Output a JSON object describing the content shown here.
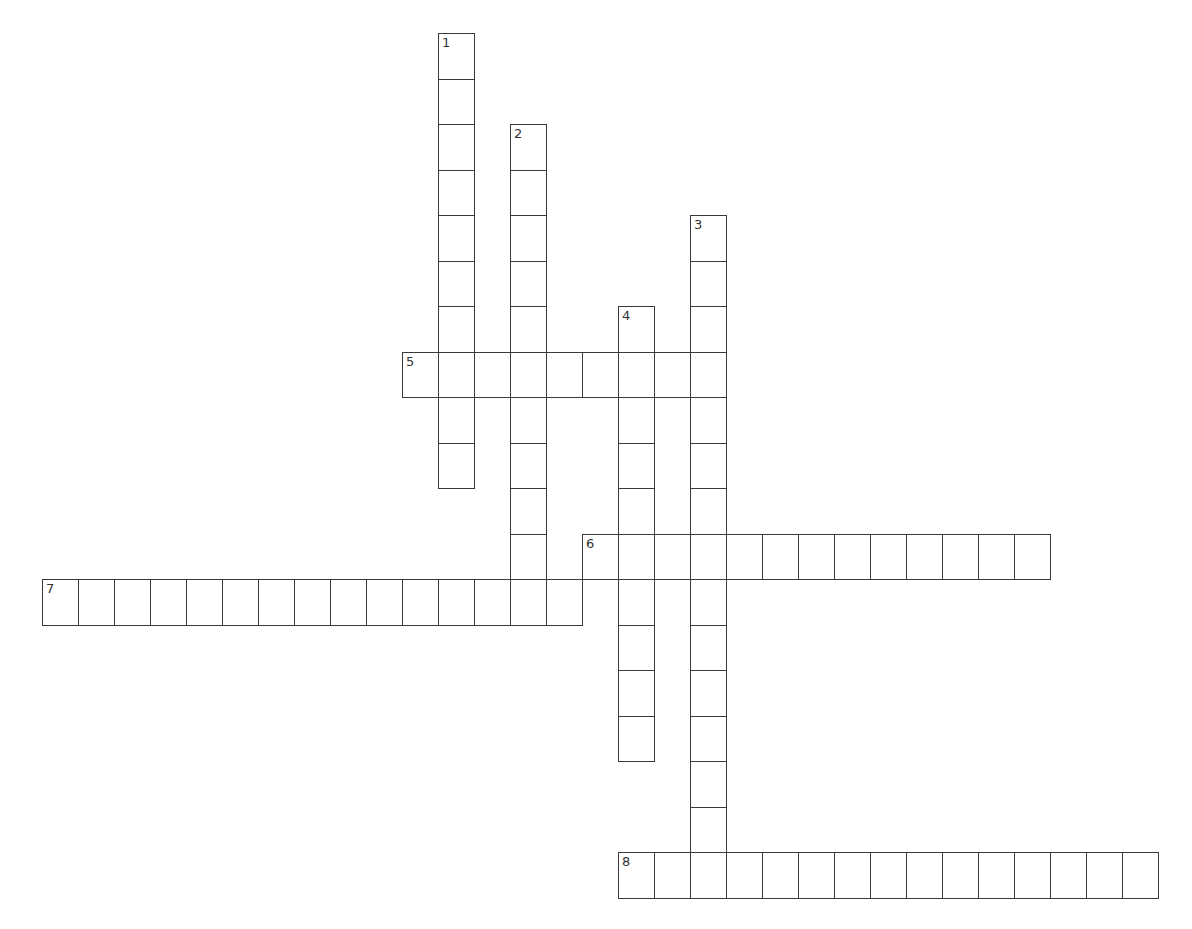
{
  "puzzle": {
    "type": "crossword",
    "cell_width": 36,
    "cell_height": 45.5,
    "origin_x": 42,
    "origin_y": 33,
    "line_color": "#3a3a3a",
    "words": [
      {
        "number": "1",
        "direction": "down",
        "col": 11,
        "row": 0,
        "length": 10
      },
      {
        "number": "2",
        "direction": "down",
        "col": 13,
        "row": 2,
        "length": 11
      },
      {
        "number": "3",
        "direction": "down",
        "col": 18,
        "row": 4,
        "length": 15
      },
      {
        "number": "4",
        "direction": "down",
        "col": 16,
        "row": 6,
        "length": 10
      },
      {
        "number": "5",
        "direction": "across",
        "col": 10,
        "row": 7,
        "length": 9
      },
      {
        "number": "6",
        "direction": "across",
        "col": 15,
        "row": 11,
        "length": 13
      },
      {
        "number": "7",
        "direction": "across",
        "col": 0,
        "row": 12,
        "length": 15
      },
      {
        "number": "8",
        "direction": "across",
        "col": 16,
        "row": 18,
        "length": 15
      }
    ]
  }
}
